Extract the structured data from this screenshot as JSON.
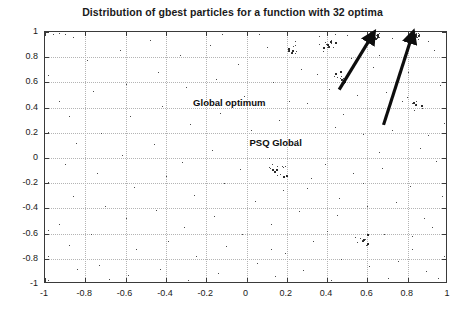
{
  "chart_data": {
    "type": "scatter",
    "title": "Distribution of gbest particles for a function with 32 optima",
    "xlabel": "",
    "ylabel": "",
    "xlim": [
      -1,
      1
    ],
    "ylim": [
      -1,
      1
    ],
    "grid": true,
    "legend": null,
    "marker": {
      "color": "#4a4a4a",
      "size": 1,
      "symbol": "dot"
    },
    "xticks": [
      "-1",
      "-0.8",
      "-0.6",
      "-0.4",
      "-0.2",
      "0",
      "0.2",
      "0.4",
      "0.6",
      "0.8",
      "1"
    ],
    "xtick_values": [
      -1,
      -0.8,
      -0.6,
      -0.4,
      -0.2,
      0,
      0.2,
      0.4,
      0.6,
      0.8,
      1
    ],
    "yticks": [
      "1",
      "0.8",
      "0.6",
      "0.4",
      "0.2",
      "0",
      "-0.2",
      "-0.4",
      "-0.6",
      "-0.8",
      "-1"
    ],
    "ytick_values": [
      1,
      0.8,
      0.6,
      0.4,
      0.2,
      0,
      -0.2,
      -0.4,
      -0.6,
      -0.8,
      -1
    ],
    "annotations": [
      {
        "text": "Global optimum",
        "label_x": -0.26,
        "label_y": 0.475,
        "arrow_tail_x": 0.465,
        "arrow_tail_y": 0.535,
        "arrow_tip_x": 0.625,
        "arrow_tip_y": 0.955
      },
      {
        "text": "PSQ Global",
        "label_x": 0.02,
        "label_y": 0.155,
        "arrow_tail_x": 0.685,
        "arrow_tail_y": 0.255,
        "arrow_tip_x": 0.825,
        "arrow_tip_y": 0.955
      }
    ],
    "clusters": [
      {
        "center_x": 0.62,
        "center_y": 0.97,
        "count": 42,
        "spread_x": 0.035,
        "spread_y": 0.035,
        "note": "global optimum cluster"
      },
      {
        "center_x": 0.825,
        "center_y": 0.975,
        "count": 40,
        "spread_x": 0.03,
        "spread_y": 0.03,
        "note": "PSQ global cluster"
      },
      {
        "center_x": 0.405,
        "center_y": 0.905,
        "count": 16,
        "spread_x": 0.045,
        "spread_y": 0.05
      },
      {
        "center_x": 0.22,
        "center_y": 0.86,
        "count": 10,
        "spread_x": 0.04,
        "spread_y": 0.05
      },
      {
        "center_x": 0.465,
        "center_y": 0.64,
        "count": 12,
        "spread_x": 0.04,
        "spread_y": 0.06
      },
      {
        "center_x": 0.165,
        "center_y": -0.095,
        "count": 14,
        "spread_x": 0.06,
        "spread_y": 0.07
      },
      {
        "center_x": 0.59,
        "center_y": -0.655,
        "count": 10,
        "spread_x": 0.05,
        "spread_y": 0.05
      },
      {
        "center_x": 0.83,
        "center_y": 0.44,
        "count": 8,
        "spread_x": 0.04,
        "spread_y": 0.06
      }
    ],
    "points": [
      [
        -0.96,
        0.985
      ],
      [
        -0.93,
        0.99
      ],
      [
        -0.9,
        0.985
      ],
      [
        -0.86,
        0.96
      ],
      [
        -0.985,
        0.66
      ],
      [
        -0.985,
        0.205
      ],
      [
        -0.985,
        -0.19
      ],
      [
        -0.985,
        -0.575
      ],
      [
        -0.985,
        -0.775
      ],
      [
        -0.985,
        -0.965
      ],
      [
        -0.93,
        0.45
      ],
      [
        -0.88,
        0.335
      ],
      [
        -0.845,
        0.12
      ],
      [
        -0.9,
        -0.05
      ],
      [
        -0.86,
        -0.3
      ],
      [
        -0.93,
        -0.52
      ],
      [
        -0.88,
        -0.69
      ],
      [
        -0.84,
        -0.88
      ],
      [
        -0.79,
        0.78
      ],
      [
        -0.76,
        0.53
      ],
      [
        -0.72,
        0.2
      ],
      [
        -0.74,
        -0.12
      ],
      [
        -0.7,
        -0.38
      ],
      [
        -0.77,
        -0.6
      ],
      [
        -0.73,
        -0.85
      ],
      [
        -0.68,
        -0.96
      ],
      [
        -0.63,
        0.86
      ],
      [
        -0.6,
        0.59
      ],
      [
        -0.58,
        0.33
      ],
      [
        -0.62,
        0.02
      ],
      [
        -0.56,
        -0.23
      ],
      [
        -0.6,
        -0.48
      ],
      [
        -0.55,
        -0.72
      ],
      [
        -0.59,
        -0.93
      ],
      [
        -0.48,
        0.94
      ],
      [
        -0.44,
        0.68
      ],
      [
        -0.42,
        0.41
      ],
      [
        -0.46,
        0.11
      ],
      [
        -0.4,
        -0.14
      ],
      [
        -0.45,
        -0.41
      ],
      [
        -0.39,
        -0.66
      ],
      [
        -0.43,
        -0.88
      ],
      [
        -0.33,
        0.82
      ],
      [
        -0.3,
        0.56
      ],
      [
        -0.28,
        0.27
      ],
      [
        -0.32,
        -0.03
      ],
      [
        -0.26,
        -0.29
      ],
      [
        -0.31,
        -0.55
      ],
      [
        -0.25,
        -0.78
      ],
      [
        -0.29,
        -0.97
      ],
      [
        -0.18,
        0.9
      ],
      [
        -0.15,
        0.63
      ],
      [
        -0.13,
        0.36
      ],
      [
        -0.17,
        0.06
      ],
      [
        -0.11,
        -0.2
      ],
      [
        -0.16,
        -0.46
      ],
      [
        -0.1,
        -0.7
      ],
      [
        -0.14,
        -0.91
      ],
      [
        -0.04,
        0.75
      ],
      [
        -0.01,
        0.49
      ],
      [
        0.02,
        0.22
      ],
      [
        -0.03,
        -0.09
      ],
      [
        0.04,
        -0.34
      ],
      [
        -0.02,
        -0.6
      ],
      [
        0.05,
        -0.83
      ],
      [
        0.0,
        -0.98
      ],
      [
        0.1,
        0.88
      ],
      [
        0.13,
        0.6
      ],
      [
        0.16,
        0.3
      ],
      [
        0.11,
        0.0
      ],
      [
        0.18,
        -0.25
      ],
      [
        0.12,
        -0.52
      ],
      [
        0.19,
        -0.75
      ],
      [
        0.14,
        -0.94
      ],
      [
        0.24,
        0.93
      ],
      [
        0.27,
        0.71
      ],
      [
        0.3,
        0.44
      ],
      [
        0.25,
        0.14
      ],
      [
        0.32,
        -0.16
      ],
      [
        0.26,
        -0.42
      ],
      [
        0.33,
        -0.66
      ],
      [
        0.28,
        -0.89
      ],
      [
        0.38,
        0.85
      ],
      [
        0.41,
        0.55
      ],
      [
        0.44,
        0.25
      ],
      [
        0.39,
        -0.05
      ],
      [
        0.46,
        -0.32
      ],
      [
        0.4,
        -0.58
      ],
      [
        0.47,
        -0.8
      ],
      [
        0.42,
        -0.97
      ],
      [
        0.52,
        0.79
      ],
      [
        0.55,
        0.5
      ],
      [
        0.58,
        0.19
      ],
      [
        0.53,
        -0.12
      ],
      [
        0.6,
        -0.38
      ],
      [
        0.54,
        -0.63
      ],
      [
        0.61,
        -0.86
      ],
      [
        0.56,
        -0.99
      ],
      [
        0.66,
        0.82
      ],
      [
        0.69,
        0.52
      ],
      [
        0.72,
        0.22
      ],
      [
        0.67,
        -0.08
      ],
      [
        0.74,
        -0.35
      ],
      [
        0.68,
        -0.6
      ],
      [
        0.75,
        -0.82
      ],
      [
        0.7,
        -0.95
      ],
      [
        0.8,
        0.68
      ],
      [
        0.83,
        0.38
      ],
      [
        0.86,
        0.08
      ],
      [
        0.81,
        -0.22
      ],
      [
        0.88,
        -0.48
      ],
      [
        0.82,
        -0.72
      ],
      [
        0.89,
        -0.9
      ],
      [
        0.84,
        -0.99
      ],
      [
        0.93,
        0.86
      ],
      [
        0.96,
        0.58
      ],
      [
        0.98,
        0.28
      ],
      [
        0.94,
        -0.02
      ],
      [
        0.97,
        -0.3
      ],
      [
        0.92,
        -0.55
      ],
      [
        0.98,
        -0.78
      ],
      [
        0.95,
        -0.95
      ],
      [
        0.36,
        0.97
      ],
      [
        0.5,
        0.98
      ],
      [
        0.72,
        0.95
      ],
      [
        0.9,
        0.93
      ],
      [
        0.2,
        0.985
      ],
      [
        0.06,
        0.985
      ],
      [
        -0.12,
        0.985
      ],
      [
        0.44,
        0.985
      ],
      [
        0.63,
        0.72
      ],
      [
        0.77,
        0.45
      ],
      [
        0.35,
        0.67
      ],
      [
        0.21,
        0.45
      ],
      [
        0.48,
        0.35
      ],
      [
        0.3,
        -0.24
      ],
      [
        0.58,
        -0.2
      ],
      [
        0.12,
        -0.72
      ],
      [
        0.82,
        -0.62
      ],
      [
        0.9,
        0.18
      ],
      [
        0.66,
        0.05
      ],
      [
        0.45,
        -0.45
      ]
    ]
  }
}
